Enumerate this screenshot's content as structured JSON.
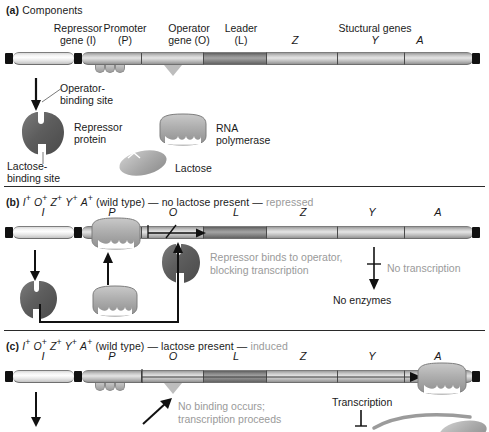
{
  "figure": {
    "colors": {
      "ink": "#1a1a1a",
      "muted_text": "#9a9a9a",
      "dna_light": "#f0f0f0",
      "dna_mid": "#c6c6c6",
      "dna_leader_dark": "#8a8a8a",
      "protein_dark": "#5a5a5a",
      "protein_mid": "#b4b4b4"
    }
  },
  "panel_a": {
    "label": "(a)",
    "title": "Components",
    "headers": [
      {
        "line1": "Repressor",
        "line2": "gene (I)"
      },
      {
        "line1": "Promoter",
        "line2": "(P)"
      },
      {
        "line1": "Operator",
        "line2": "gene (O)"
      },
      {
        "line1": "Leader",
        "line2": "(L)"
      },
      {
        "line1": "",
        "line2": "Z"
      },
      {
        "line1": "Stuctural genes",
        "line2": "Y"
      },
      {
        "line1": "",
        "line2": "A"
      }
    ],
    "annotations": {
      "operator_binding_site": "Operator-\nbinding site",
      "operator_binding_site_l1": "Operator-",
      "operator_binding_site_l2": "binding site",
      "lactose_binding_site_l1": "Lactose-",
      "lactose_binding_site_l2": "binding site",
      "repressor_protein_l1": "Repressor",
      "repressor_protein_l2": "protein",
      "rna_polymerase_l1": "RNA",
      "rna_polymerase_l2": "polymerase",
      "lactose": "Lactose"
    }
  },
  "panel_b": {
    "label": "(b)",
    "genotype": "I+ O+ Z+ Y+ A+",
    "genotype_parts": [
      "I",
      "O",
      "Z",
      "Y",
      "A"
    ],
    "wild_type": "(wild type)",
    "dash1": "—",
    "condition": "no lactose present",
    "dash2": "—",
    "state": "repressed",
    "gene_labels": [
      "I",
      "P",
      "O",
      "L",
      "Z",
      "Y",
      "A"
    ],
    "annotations": {
      "repressor_binds_l1": "Repressor binds to operator,",
      "repressor_binds_l2": "blocking transcription",
      "no_transcription": "No transcription",
      "no_enzymes": "No enzymes"
    }
  },
  "panel_c": {
    "label": "(c)",
    "genotype": "I+ O+ Z+ Y+ A+",
    "genotype_parts": [
      "I",
      "O",
      "Z",
      "Y",
      "A"
    ],
    "wild_type": "(wild type)",
    "dash1": "—",
    "condition": "lactose present",
    "dash2": "—",
    "state": "induced",
    "gene_labels": [
      "I",
      "P",
      "O",
      "L",
      "Z",
      "Y",
      "A"
    ],
    "annotations": {
      "no_binding_l1": "No binding occurs;",
      "no_binding_l2": "transcription proceeds",
      "transcription": "Transcription"
    }
  },
  "icons": {
    "arrow_down": "arrow-down-icon",
    "arrow_up": "arrow-up-icon",
    "arrow_right": "arrow-right-icon",
    "blocked_arrow": "blocked-arrow-icon",
    "repressor": "repressor-protein-icon",
    "rnap": "rna-polymerase-icon",
    "lactose": "lactose-icon"
  }
}
